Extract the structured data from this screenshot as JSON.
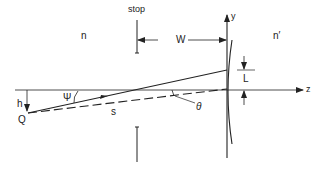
{
  "diagram": {
    "type": "optics-geometry",
    "colors": {
      "line": "#222222",
      "background": "#ffffff"
    },
    "labels": {
      "stop": "stop",
      "n": "n",
      "n_prime": "n′",
      "W": "W",
      "y_axis": "y",
      "z_axis": "z",
      "L": "L",
      "h": "h",
      "psi": "Ψ",
      "Q": "Q",
      "s": "s",
      "theta": "θ"
    }
  }
}
